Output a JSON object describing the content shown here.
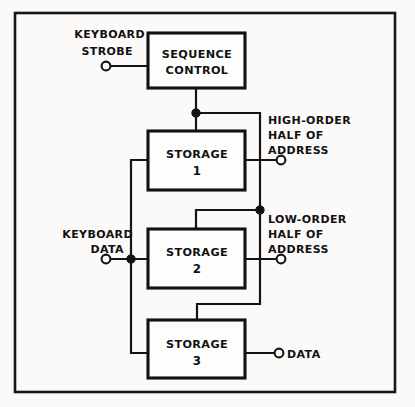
{
  "diagram": {
    "style": "hand-drawn technical block diagram",
    "ink_color": "#141417",
    "paper_color": "#fbfaf8",
    "blocks": [
      {
        "id": "sequence-control",
        "line1": "SEQUENCE",
        "line2": "CONTROL"
      },
      {
        "id": "storage-1",
        "line1": "STORAGE",
        "line2": "1"
      },
      {
        "id": "storage-2",
        "line1": "STORAGE",
        "line2": "2"
      },
      {
        "id": "storage-3",
        "line1": "STORAGE",
        "line2": "3"
      }
    ],
    "terminals": [
      {
        "id": "keyboard-strobe",
        "kind": "input",
        "line1": "KEYBOARD",
        "line2": "STROBE"
      },
      {
        "id": "keyboard-data",
        "kind": "input",
        "line1": "KEYBOARD",
        "line2": "DATA"
      },
      {
        "id": "high-order-address",
        "kind": "output",
        "line1": "HIGH-ORDER",
        "line2": "HALF OF",
        "line3": "ADDRESS"
      },
      {
        "id": "low-order-address",
        "kind": "output",
        "line1": "LOW-ORDER",
        "line2": "HALF OF",
        "line3": "ADDRESS"
      },
      {
        "id": "data-output",
        "kind": "output",
        "line1": "DATA"
      }
    ]
  }
}
